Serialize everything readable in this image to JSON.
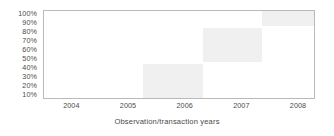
{
  "chart_data": {
    "type": "bar",
    "title": "",
    "subtitle": "",
    "xlabel": "Observation/transaction years",
    "ylabel": "",
    "grid": false,
    "legend": "none",
    "xlim": [
      2003.5,
      2008.3
    ],
    "ylim": [
      5,
      105
    ],
    "x_tick_labels": [
      "2004",
      "2005",
      "2006",
      "2007",
      "2008"
    ],
    "x_tick_values": [
      2004,
      2005,
      2006,
      2007,
      2008
    ],
    "y_tick_labels": [
      "100%",
      "90%",
      "80%",
      "70%",
      "60%",
      "50%",
      "40%",
      "30%",
      "20%",
      "10%"
    ],
    "y_tick_values": [
      100,
      90,
      80,
      70,
      60,
      50,
      40,
      30,
      20,
      10
    ],
    "block_color": "#f0f0f0",
    "frame_color": "#b9b9b9",
    "text_color": "#4a4a4a",
    "blocks": [
      {
        "name": "block-1",
        "x_start": 2005.25,
        "x_end": 2006.3,
        "y_low": 5,
        "y_high": 45
      },
      {
        "name": "block-2",
        "x_start": 2006.3,
        "x_end": 2007.35,
        "y_low": 48,
        "y_high": 86
      },
      {
        "name": "block-3",
        "x_start": 2007.35,
        "x_end": 2008.3,
        "y_low": 88,
        "y_high": 105
      }
    ],
    "series": [
      {
        "name": "Observation/transaction coverage",
        "categories": [
          "2004",
          "2005",
          "2006",
          "2007",
          "2008"
        ],
        "values": [
          0,
          40,
          40,
          85,
          100
        ]
      }
    ]
  }
}
